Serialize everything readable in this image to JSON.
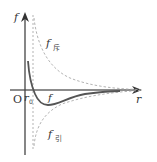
{
  "diagram": {
    "type": "molecular-force-vs-distance",
    "axes": {
      "y_label": "f",
      "x_label": "r",
      "origin_label": "O",
      "equilibrium_label": "r",
      "equilibrium_subscript": "0"
    },
    "curves": {
      "net_force_label": "f",
      "repulsive_label": "f",
      "repulsive_subscript": "斥",
      "attractive_label": "f",
      "attractive_subscript": "引"
    },
    "colors": {
      "axis": "#222222",
      "net_curve": "#555555",
      "dashed": "#aaaaaa",
      "text": "#333333"
    }
  }
}
